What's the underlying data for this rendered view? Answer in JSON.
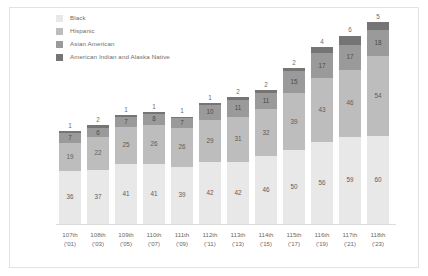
{
  "chart_data": {
    "type": "bar",
    "stacked": true,
    "title": "",
    "subtitle": "",
    "xlabel": "",
    "ylabel": "",
    "grid": false,
    "legend_position": "top-left",
    "ylim": [
      0,
      140
    ],
    "categories": [
      "107th",
      "108th",
      "109th",
      "110th",
      "111th",
      "112th",
      "113th",
      "114th",
      "115th",
      "116th",
      "117th",
      "118th"
    ],
    "category_years": [
      "('01)",
      "('03)",
      "('05)",
      "('07)",
      "('09)",
      "('11)",
      "('13)",
      "('15)",
      "('17)",
      "('19)",
      "('21)",
      "('23)"
    ],
    "series": [
      {
        "name": "Black",
        "color": "#e8e8e8",
        "values": [
          36,
          37,
          41,
          41,
          39,
          42,
          42,
          46,
          50,
          56,
          59,
          60
        ]
      },
      {
        "name": "Hispanic",
        "color": "#bdbdbd",
        "values": [
          19,
          22,
          25,
          26,
          26,
          29,
          31,
          32,
          39,
          43,
          46,
          54
        ]
      },
      {
        "name": "Asian American",
        "color": "#9a9a9a",
        "values": [
          7,
          6,
          7,
          8,
          7,
          10,
          11,
          11,
          15,
          17,
          17,
          18
        ]
      },
      {
        "name": "American Indian and Alaska Native",
        "color": "#757575",
        "values": [
          1,
          2,
          1,
          1,
          1,
          1,
          2,
          2,
          2,
          4,
          6,
          5
        ]
      }
    ]
  },
  "legend": {
    "items": [
      {
        "label": "Black",
        "color": "#e8e8e8"
      },
      {
        "label": "Hispanic",
        "color": "#bdbdbd"
      },
      {
        "label": "Asian American",
        "color": "#9a9a9a"
      },
      {
        "label": "American Indian and Alaska Native",
        "color": "#757575"
      }
    ]
  }
}
